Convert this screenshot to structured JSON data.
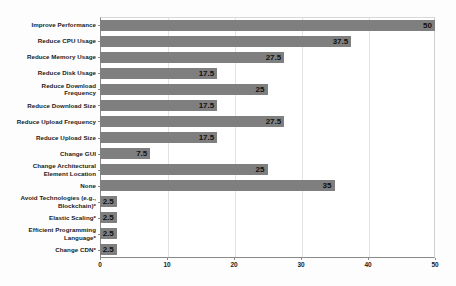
{
  "chart_data": {
    "type": "bar",
    "orientation": "horizontal",
    "title": "",
    "subtitle": "",
    "xlabel": "",
    "ylabel": "",
    "xlim": [
      0,
      50
    ],
    "xticks": [
      0,
      10,
      20,
      30,
      40,
      50
    ],
    "xtick_labels": [
      "0",
      "10",
      "20",
      "30",
      "40",
      "50"
    ],
    "grid": true,
    "grid_axis": "x",
    "legend": false,
    "legend_position": "none",
    "bar_color": "#7f7f7f",
    "label_color": "#111111",
    "show_value_labels": true,
    "value_label_position": "inside-end",
    "categories": [
      "Improve Performance",
      "Reduce CPU Usage",
      "Reduce Memory Usage",
      "Reduce Disk Usage",
      "Reduce Download Frequency",
      "Reduce Download Size",
      "Reduce Upload Frequency",
      "Reduce Upload Size",
      "Change GUI",
      "Change Architectural Element Location",
      "None",
      "Avoid Technologies (e.g., Blockchain)*",
      "Elastic Scaling*",
      "Efficient Programming Language*",
      "Change CDN*"
    ],
    "values": [
      50,
      37.5,
      27.5,
      17.5,
      25,
      17.5,
      27.5,
      17.5,
      7.5,
      25,
      35,
      2.5,
      2.5,
      2.5,
      2.5
    ],
    "value_labels": [
      "50",
      "37.5",
      "27.5",
      "17.5",
      "25",
      "17.5",
      "27.5",
      "17.5",
      "7.5",
      "25",
      "35",
      "2.5",
      "2.5",
      "2.5",
      "2.5"
    ],
    "category_lines": [
      [
        "Improve Performance"
      ],
      [
        "Reduce CPU Usage"
      ],
      [
        "Reduce Memory Usage"
      ],
      [
        "Reduce Disk Usage"
      ],
      [
        "Reduce Download",
        "Frequency"
      ],
      [
        "Reduce Download Size"
      ],
      [
        "Reduce Upload Frequency"
      ],
      [
        "Reduce Upload Size"
      ],
      [
        "Change GUI"
      ],
      [
        "Change Architectural",
        "Element Location"
      ],
      [
        "None"
      ],
      [
        "Avoid Technologies (e.g.,",
        "Blockchain)*"
      ],
      [
        "Elastic Scaling*"
      ],
      [
        "Efficient Programming",
        "Language*"
      ],
      [
        "Change CDN*"
      ]
    ]
  }
}
